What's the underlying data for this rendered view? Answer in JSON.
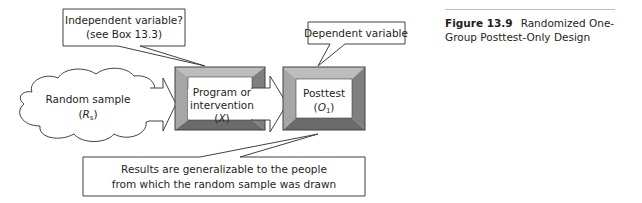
{
  "diagram": {
    "callouts": {
      "independent": {
        "line1": "Independent variable?",
        "line2": "(see Box 13.3)"
      },
      "dependent": {
        "line1": "Dependent variable"
      },
      "results": {
        "line1": "Results are generalizable to the people",
        "line2": "from which the random sample was drawn"
      }
    },
    "sample": {
      "line1": "Random sample",
      "symbol": "R",
      "subscript": "s"
    },
    "program_box": {
      "line1": "Program or",
      "line2": "intervention",
      "symbol": "X"
    },
    "posttest_box": {
      "line1": "Posttest",
      "symbol": "O",
      "subscript": "1"
    },
    "colors": {
      "frame_top": "#bdbdbd",
      "frame_left": "#a6a6a6",
      "frame_right": "#7f7f7f",
      "frame_bottom": "#6b6b6b",
      "stroke": "#404040"
    }
  },
  "caption": {
    "figure_number": "Figure 13.9",
    "title": "Randomized One-Group Posttest-Only Design"
  }
}
